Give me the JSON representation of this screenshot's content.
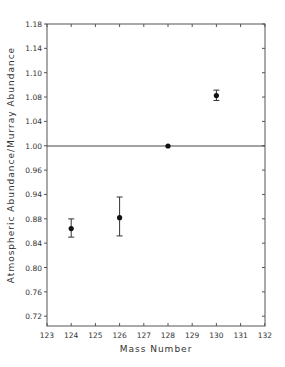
{
  "chart_data": {
    "type": "scatter",
    "title": "",
    "xlabel": "Mass Number",
    "ylabel": "Atmospheric Abundance/Murray Abundance",
    "xlim": [
      123,
      132
    ],
    "ylim": [
      0.7,
      1.18
    ],
    "grid": false,
    "legend": null,
    "x_ticks": [
      "123",
      "124",
      "125",
      "126",
      "127",
      "128",
      "129",
      "130",
      "131",
      "132"
    ],
    "y_tick_labels_as_printed": [
      "1.18",
      "1.14",
      "1.10",
      "1.08",
      "1.04",
      "1.00",
      "0.96",
      "0.94",
      "0.88",
      "0.84",
      "0.80",
      "0.76",
      "0.72"
    ],
    "reference_line": {
      "y": 1.0,
      "style": "solid"
    },
    "points": [
      {
        "x": 124,
        "y": 0.864,
        "err_low": 0.85,
        "err_high": 0.88
      },
      {
        "x": 126,
        "y": 0.882,
        "err_low": 0.852,
        "err_high": 0.916
      },
      {
        "x": 128,
        "y": 1.0,
        "err_low": null,
        "err_high": null
      },
      {
        "x": 130,
        "y": 1.083,
        "err_low": 1.075,
        "err_high": 1.092
      }
    ]
  },
  "layout": {
    "frame": {
      "left": 47,
      "top": 24,
      "right": 265,
      "bottom": 326
    },
    "x_px_per_unit": 24.2,
    "y_ref_value": 1.0,
    "y_ref_px": 146,
    "y_px_per_unit": 607.5,
    "y_tick_first_px": 24,
    "y_tick_step_px": 24.35,
    "colors": {
      "ink": "#1a1a1a",
      "frame": "#555555"
    }
  }
}
